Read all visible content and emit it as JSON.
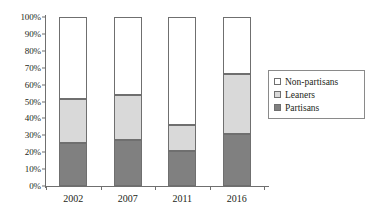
{
  "chart_data": {
    "type": "bar",
    "subtype": "100% stacked bar",
    "title": "",
    "xlabel": "",
    "ylabel": "",
    "categories": [
      "2002",
      "2007",
      "2011",
      "2016"
    ],
    "series": [
      {
        "name": "Partisans",
        "values": [
          25.5,
          27.5,
          21.0,
          30.5
        ],
        "color": "#808080"
      },
      {
        "name": "Leaners",
        "values": [
          26.0,
          26.5,
          15.0,
          35.5
        ],
        "color": "#d9d9d9"
      },
      {
        "name": "Non-partisans",
        "values": [
          48.5,
          46.0,
          64.0,
          34.0
        ],
        "color": "#ffffff"
      }
    ],
    "cumulative_tops": {
      "partisans": [
        25.5,
        27.5,
        21.0,
        30.5
      ],
      "leaners": [
        51.5,
        54.0,
        36.0,
        66.0
      ],
      "total": [
        100,
        100,
        100,
        100
      ]
    },
    "ylim": [
      0,
      100
    ],
    "ytick_labels": [
      "0%",
      "10%",
      "20%",
      "30%",
      "40%",
      "50%",
      "60%",
      "70%",
      "80%",
      "90%",
      "100%"
    ],
    "ytick_values": [
      0,
      10,
      20,
      30,
      40,
      50,
      60,
      70,
      80,
      90,
      100
    ],
    "grid": false,
    "legend_position": "right"
  },
  "legend": {
    "items": [
      {
        "label": "Non-partisans",
        "swatch": "#ffffff"
      },
      {
        "label": "Leaners",
        "swatch": "#d9d9d9"
      },
      {
        "label": "Partisans",
        "swatch": "#808080"
      }
    ]
  }
}
